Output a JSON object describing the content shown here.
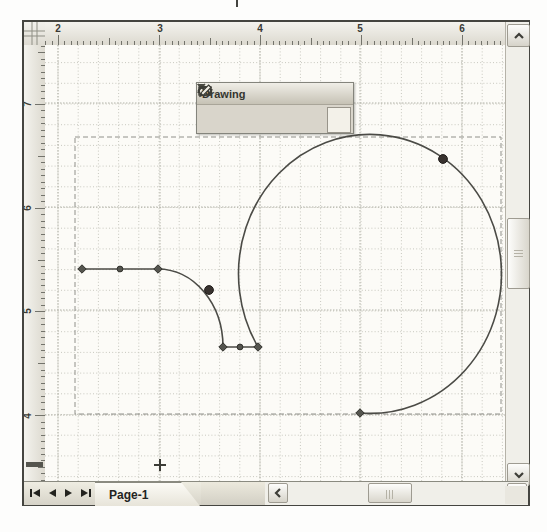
{
  "colors": {
    "shape-stroke": "#4b4b46",
    "marker-fill": "#55554f",
    "marker-edge": "#32322d",
    "control-fill": "#38322f",
    "grid-minor": "#c8c8bf",
    "grid-major": "#b2b2a8",
    "selection-dash": "#90908a",
    "icon-dark": "#3c3c36"
  },
  "rulers": {
    "horizontal": {
      "unit_px": 101,
      "labels": [
        {
          "text": "2",
          "x": 13
        },
        {
          "text": "3",
          "x": 115
        },
        {
          "text": "4",
          "x": 215
        },
        {
          "text": "5",
          "x": 315
        },
        {
          "text": "6",
          "x": 417
        }
      ]
    },
    "vertical": {
      "unit_px": 103.7,
      "labels": [
        {
          "text": "7",
          "y": 59
        },
        {
          "text": "6",
          "y": 163
        },
        {
          "text": "5",
          "y": 266
        },
        {
          "text": "4",
          "y": 371
        }
      ],
      "cursor_mark_y": 417
    }
  },
  "toolbar": {
    "title": "Drawing",
    "tools": [
      "rectangle",
      "ellipse",
      "line",
      "arc",
      "freeform",
      "pencil"
    ],
    "selected_tool": "pencil"
  },
  "canvas": {
    "grid": {
      "w": 460,
      "h": 436,
      "minor_dx": 20.2,
      "minor_dy": 20.7,
      "first_x": 13,
      "first_y": 17.6,
      "major_x": [
        13,
        115,
        215,
        315,
        417
      ],
      "major_y": [
        58,
        162,
        265,
        370
      ]
    },
    "selection_box": {
      "x": 30,
      "y": 92,
      "w": 426,
      "h": 277
    },
    "shape": {
      "path_d": "M 37 224 L 113 224 A 65 78 0 0 1 178 302 L 213 302 A 131.5 139.5 0 1 1 315 368",
      "vertices": [
        [
          37,
          224
        ],
        [
          113,
          224
        ],
        [
          178,
          302
        ],
        [
          213,
          302
        ],
        [
          315,
          368
        ]
      ],
      "midpoints": [
        [
          75,
          224
        ],
        [
          195,
          302
        ]
      ],
      "control_points": [
        [
          164,
          245
        ],
        [
          398,
          114
        ]
      ]
    },
    "cursor_cross": {
      "x": 115,
      "y": 420
    }
  },
  "scrollbars": {
    "vertical": {
      "thumb_top": 196,
      "thumb_height": 69
    },
    "horizontal": {
      "thumb_left": 103,
      "thumb_width": 44
    }
  },
  "bottom_bar": {
    "page_tab": "Page-1"
  }
}
